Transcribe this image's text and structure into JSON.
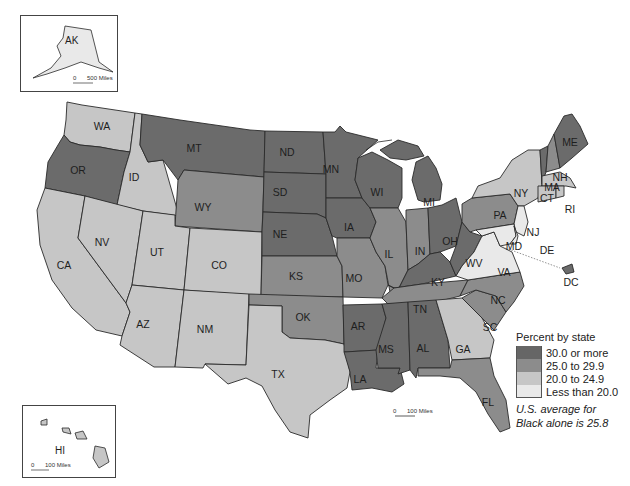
{
  "title": "Percent by state",
  "legend": {
    "title": "Percent by state",
    "classes": [
      {
        "label": "30.0 or more",
        "color": "#666666"
      },
      {
        "label": "25.0 to 29.9",
        "color": "#8c8c8c"
      },
      {
        "label": "20.0 to 24.9",
        "color": "#c6c6c6"
      },
      {
        "label": "Less than 20.0",
        "color": "#e9e9e9"
      }
    ],
    "note_line1": "U.S. average for",
    "note_line2": "Black alone is 25.8"
  },
  "insets": {
    "alaska": {
      "label": "AK",
      "scale_zero": "0",
      "scale_label": "500 Miles"
    },
    "hawaii": {
      "label": "HI",
      "scale_zero": "0",
      "scale_label": "100 Miles"
    }
  },
  "main_scale": {
    "scale_zero": "0",
    "scale_label": "100 Miles"
  },
  "states": {
    "WA": {
      "label": "WA",
      "class": "20.0 to 24.9"
    },
    "OR": {
      "label": "OR",
      "class": "30.0 or more"
    },
    "CA": {
      "label": "CA",
      "class": "20.0 to 24.9"
    },
    "ID": {
      "label": "ID",
      "class": "20.0 to 24.9"
    },
    "NV": {
      "label": "NV",
      "class": "20.0 to 24.9"
    },
    "MT": {
      "label": "MT",
      "class": "30.0 or more"
    },
    "WY": {
      "label": "WY",
      "class": "25.0 to 29.9"
    },
    "UT": {
      "label": "UT",
      "class": "20.0 to 24.9"
    },
    "CO": {
      "label": "CO",
      "class": "20.0 to 24.9"
    },
    "AZ": {
      "label": "AZ",
      "class": "20.0 to 24.9"
    },
    "NM": {
      "label": "NM",
      "class": "20.0 to 24.9"
    },
    "ND": {
      "label": "ND",
      "class": "30.0 or more"
    },
    "SD": {
      "label": "SD",
      "class": "30.0 or more"
    },
    "NE": {
      "label": "NE",
      "class": "30.0 or more"
    },
    "KS": {
      "label": "KS",
      "class": "25.0 to 29.9"
    },
    "OK": {
      "label": "OK",
      "class": "25.0 to 29.9"
    },
    "TX": {
      "label": "TX",
      "class": "20.0 to 24.9"
    },
    "MN": {
      "label": "MN",
      "class": "30.0 or more"
    },
    "IA": {
      "label": "IA",
      "class": "30.0 or more"
    },
    "MO": {
      "label": "MO",
      "class": "25.0 to 29.9"
    },
    "AR": {
      "label": "AR",
      "class": "30.0 or more"
    },
    "LA": {
      "label": "LA",
      "class": "30.0 or more"
    },
    "WI": {
      "label": "WI",
      "class": "30.0 or more"
    },
    "IL": {
      "label": "IL",
      "class": "25.0 to 29.9"
    },
    "MI": {
      "label": "MI",
      "class": "30.0 or more"
    },
    "IN": {
      "label": "IN",
      "class": "25.0 to 29.9"
    },
    "OH": {
      "label": "OH",
      "class": "30.0 or more"
    },
    "KY": {
      "label": "KY",
      "class": "30.0 or more"
    },
    "TN": {
      "label": "TN",
      "class": "25.0 to 29.9"
    },
    "MS": {
      "label": "MS",
      "class": "30.0 or more"
    },
    "AL": {
      "label": "AL",
      "class": "30.0 or more"
    },
    "GA": {
      "label": "GA",
      "class": "20.0 to 24.9"
    },
    "FL": {
      "label": "FL",
      "class": "25.0 to 29.9"
    },
    "SC": {
      "label": "SC",
      "class": "25.0 to 29.9"
    },
    "NC": {
      "label": "NC",
      "class": "25.0 to 29.9"
    },
    "VA": {
      "label": "VA",
      "class": "Less than 20.0"
    },
    "WV": {
      "label": "WV",
      "class": "30.0 or more"
    },
    "PA": {
      "label": "PA",
      "class": "25.0 to 29.9"
    },
    "NY": {
      "label": "NY",
      "class": "20.0 to 24.9"
    },
    "NJ": {
      "label": "NJ",
      "class": "Less than 20.0"
    },
    "DE": {
      "label": "DE",
      "class": "Less than 20.0"
    },
    "MD": {
      "label": "MD",
      "class": "Less than 20.0"
    },
    "DC": {
      "label": "DC",
      "class": "30.0 or more"
    },
    "VT": {
      "label": "VT",
      "class": "30.0 or more"
    },
    "NH": {
      "label": "NH",
      "class": "25.0 to 29.9"
    },
    "ME": {
      "label": "ME",
      "class": "30.0 or more"
    },
    "MA": {
      "label": "MA",
      "class": "20.0 to 24.9"
    },
    "CT": {
      "label": "CT",
      "class": "20.0 to 24.9"
    },
    "RI": {
      "label": "RI",
      "class": "20.0 to 24.9"
    },
    "AK": {
      "label": "AK",
      "class": "Less than 20.0"
    },
    "HI": {
      "label": "HI",
      "class": "20.0 to 24.9"
    }
  }
}
